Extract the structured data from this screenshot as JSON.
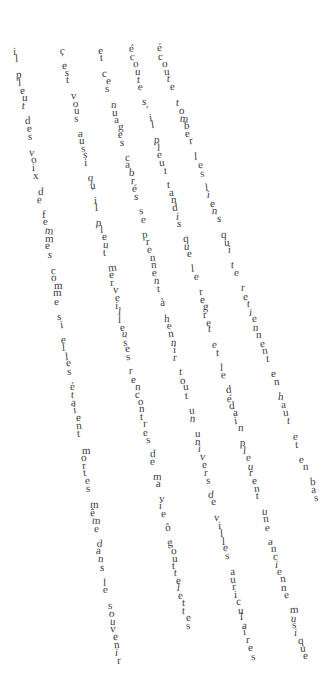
{
  "poem": {
    "title": "Il Pleut",
    "language": "fr",
    "text_color": "#3b3b42",
    "background_color": "#ffffff",
    "lines": [
      {
        "id": "line-1",
        "text": "il pleut des voix de femmes comme si elles étaient mortes même dans le souvenir",
        "start_x": 13,
        "start_y": 45,
        "end_x": 116,
        "end_y": 655,
        "letter_step_y": 7.8,
        "font_size": 11
      },
      {
        "id": "line-2",
        "text": "c'est vous aussi qu'il pleut merveilleuses rencontres de ma vie ô gouttelettes",
        "start_x": 60,
        "start_y": 45,
        "end_x": 186,
        "end_y": 620,
        "letter_step_y": 7.5,
        "font_size": 11
      },
      {
        "id": "line-3",
        "text": "et ces nuages cabrés se prennent à hennir tout un univers de villes auriculaires",
        "start_x": 97,
        "start_y": 45,
        "end_x": 250,
        "end_y": 650,
        "letter_step_y": 7.6,
        "font_size": 11
      },
      {
        "id": "line-4",
        "text": "écoute s'il pleut tandis que le regret et le dédain pleurent une ancienne musique",
        "start_x": 128,
        "start_y": 43,
        "end_x": 302,
        "end_y": 650,
        "letter_step_y": 7.6,
        "font_size": 11
      },
      {
        "id": "line-5",
        "text": "écoute tomber les liens qui te retiennent en haut et en bas",
        "start_x": 156,
        "start_y": 43,
        "end_x": 314,
        "end_y": 492,
        "letter_step_y": 7.7,
        "font_size": 11
      }
    ]
  }
}
